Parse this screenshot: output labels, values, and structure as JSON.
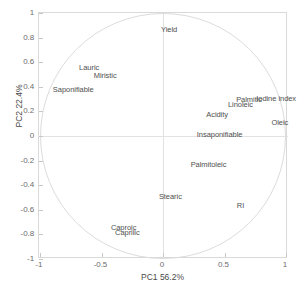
{
  "figure": {
    "background_color": "#ffffff",
    "axis_color": "#d9d9d9",
    "circle_color": "#dcdcdc",
    "text_color": "#4f4f4f"
  },
  "axes": {
    "x_title": "PC1   56.2%",
    "y_title": "PC2   22.4%",
    "x_ticks": [
      "-1",
      "-0.5",
      "0",
      "0.5",
      "1"
    ],
    "x_tick_values": [
      -1,
      -0.5,
      0,
      0.5,
      1
    ],
    "y_ticks": [
      "1",
      "0.8",
      "0.6",
      "0.4",
      "0.2",
      "0",
      "-0.2",
      "-0.4",
      "-0.6",
      "-0.8",
      "-1"
    ],
    "y_tick_values": [
      1,
      0.8,
      0.6,
      0.4,
      0.2,
      0,
      -0.2,
      -0.4,
      -0.6,
      -0.8,
      -1
    ]
  },
  "chart_data": {
    "type": "scatter",
    "title": "",
    "subtitle": "",
    "xlabel": "PC1   56.2%",
    "ylabel": "PC2   22.4%",
    "xlim": [
      -1,
      1
    ],
    "ylim": [
      -1,
      1
    ],
    "grid": false,
    "legend": "none",
    "annotations": [
      "unit correlation circle of radius 1 centred at origin"
    ],
    "variance_explained": {
      "PC1": "56.2%",
      "PC2": "22.4%"
    },
    "points": [
      {
        "label": "Yield",
        "x": 0.05,
        "y": 0.87
      },
      {
        "label": "Lauric",
        "x": -0.6,
        "y": 0.56
      },
      {
        "label": "Miristic",
        "x": -0.47,
        "y": 0.5
      },
      {
        "label": "Saponifiable",
        "x": -0.73,
        "y": 0.38
      },
      {
        "label": "Iodine index",
        "x": 0.92,
        "y": 0.31
      },
      {
        "label": "Palmitic",
        "x": 0.7,
        "y": 0.3
      },
      {
        "label": "Linoleic",
        "x": 0.63,
        "y": 0.26
      },
      {
        "label": "Acidity",
        "x": 0.44,
        "y": 0.18
      },
      {
        "label": "Oleic",
        "x": 0.95,
        "y": 0.11
      },
      {
        "label": "Insaponifiable",
        "x": 0.46,
        "y": 0.02
      },
      {
        "label": "Palmitoleic",
        "x": 0.37,
        "y": -0.23
      },
      {
        "label": "Stearic",
        "x": 0.06,
        "y": -0.49
      },
      {
        "label": "RI",
        "x": 0.63,
        "y": -0.56
      },
      {
        "label": "Caproic",
        "x": -0.32,
        "y": -0.74
      },
      {
        "label": "Caprilic",
        "x": -0.29,
        "y": -0.78
      }
    ]
  }
}
